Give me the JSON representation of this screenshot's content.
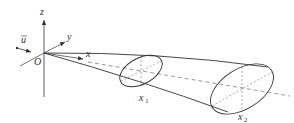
{
  "diagram": {
    "type": "3d-plume-cone",
    "colors": {
      "stroke": "#333333",
      "dashed": "#555555",
      "background": "#ffffff"
    },
    "axes": {
      "z_label": "z",
      "y_label": "y",
      "x_label": "x",
      "origin_label": "O"
    },
    "wind_vector_label": "u",
    "cross_sections": [
      {
        "label": "x",
        "subscript": "1"
      },
      {
        "label": "x",
        "subscript": "2"
      }
    ]
  }
}
